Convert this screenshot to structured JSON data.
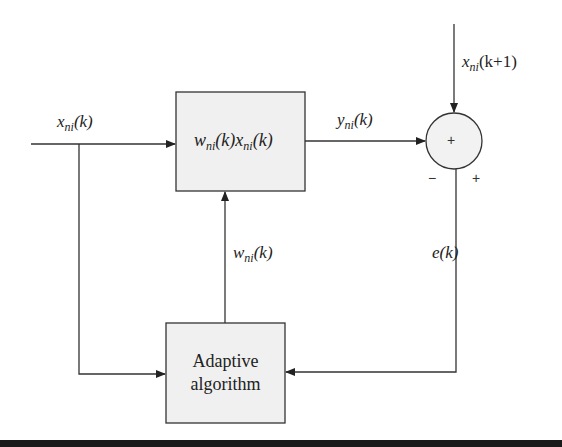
{
  "diagram": {
    "title": "",
    "blocks": {
      "multiplier": {
        "var1": "w",
        "sub1": "ni",
        "arg1": "(k)",
        "var2": "x",
        "sub2": "ni",
        "arg2": "(k)"
      },
      "adaptive": {
        "line1": "Adaptive",
        "line2": "algorithm"
      },
      "summer": {
        "center_sign": "+",
        "minus_sign": "−",
        "plus_sign": "+"
      }
    },
    "signals": {
      "input": {
        "var": "x",
        "sub": "ni",
        "arg": "(k)"
      },
      "output": {
        "var": "y",
        "sub": "ni",
        "arg": "(k)"
      },
      "desired": {
        "var": "x",
        "sub": "ni",
        "arg": "(k+1)"
      },
      "weight": {
        "var": "w",
        "sub": "ni",
        "arg": "(k)"
      },
      "error": {
        "var": "e",
        "arg": "(k)"
      }
    },
    "colors": {
      "block_fill": "#f0f0f0",
      "stroke": "#333333",
      "bar": "#1a1a1a"
    }
  }
}
